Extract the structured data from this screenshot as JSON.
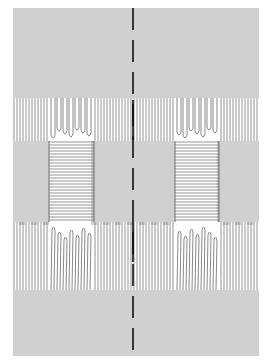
{
  "figure": {
    "colors": {
      "thread": "#7a7a7a",
      "thread_dark": "#555555",
      "background": "#ffffff",
      "fold_line": "#111111"
    },
    "bounds": {
      "x0": 13,
      "y0": 8,
      "x1": 259,
      "y1": 356
    },
    "cell": 6,
    "fold_line": {
      "x": 133,
      "dash": 22,
      "gap": 10
    },
    "bands": [
      {
        "name": "top-weave",
        "type": "weave",
        "y0": 8,
        "y1": 98
      },
      {
        "name": "upper-warp",
        "type": "warp",
        "y0": 98,
        "y1": 141,
        "loops": [
          {
            "x0": 50,
            "x1": 94
          },
          {
            "x0": 176,
            "x1": 218
          }
        ]
      },
      {
        "name": "middle",
        "type": "weave",
        "y0": 141,
        "y1": 222,
        "windows": [
          {
            "x0": 49,
            "x1": 94
          },
          {
            "x0": 175,
            "x1": 219
          }
        ]
      },
      {
        "name": "lower-warp",
        "type": "warp",
        "y0": 222,
        "y1": 290,
        "loops": [
          {
            "x0": 50,
            "x1": 94
          },
          {
            "x0": 176,
            "x1": 218
          }
        ]
      },
      {
        "name": "bottom-weave",
        "type": "weave",
        "y0": 290,
        "y1": 356
      }
    ]
  }
}
